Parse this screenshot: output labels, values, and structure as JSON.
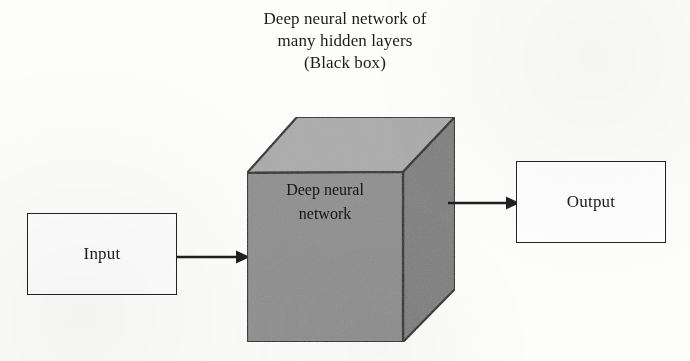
{
  "figure": {
    "title_lines": [
      "Deep neural network of",
      "many hidden layers",
      "(Black box)"
    ],
    "input_box": {
      "label": "Input"
    },
    "output_box": {
      "label": "Output"
    },
    "cube": {
      "label_lines": [
        "Deep neural",
        "network"
      ],
      "front_color": "#8f8f8f",
      "top_color": "#ababab",
      "side_color": "#808080",
      "edge_color": "#2a2a2a"
    },
    "arrows": [
      {
        "name": "input-to-network",
        "direction": "right"
      },
      {
        "name": "network-to-output",
        "direction": "right"
      }
    ],
    "background_color": "#fdfdfc",
    "line_color": "#232323"
  }
}
